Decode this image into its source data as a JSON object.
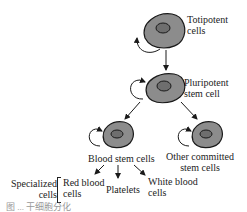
{
  "diagram": {
    "colors": {
      "cell_fill": "#8c8c8c",
      "nucleus_fill": "#6e6e6e",
      "outline": "#1a1a1a",
      "text": "#222222"
    },
    "nodes": {
      "totipotent": {
        "label_line1": "Totipotent",
        "label_line2": "cells"
      },
      "pluripotent": {
        "label_line1": "Pluripotent",
        "label_line2": "stem cell"
      },
      "blood_stem": {
        "label": "Blood stem cells"
      },
      "other_committed": {
        "label_line1": "Other committed",
        "label_line2": "stem cells"
      }
    },
    "specialized": {
      "group_label_line1": "Specialized",
      "group_label_line2": "cells",
      "red_blood_line1": "Red blood",
      "red_blood_line2": "cells",
      "platelets": "Platelets",
      "white_blood_line1": "White blood",
      "white_blood_line2": "cells"
    },
    "caption": "图 ... 干细胞分化"
  }
}
